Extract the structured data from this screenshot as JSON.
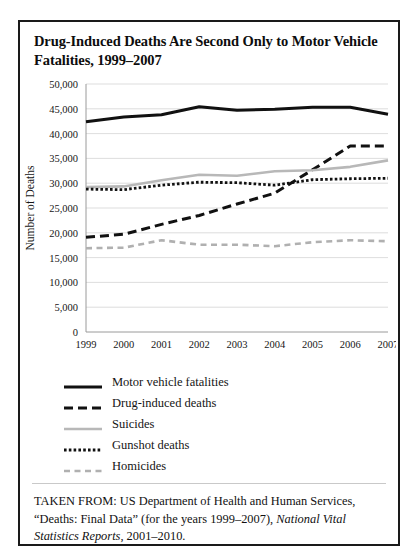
{
  "title": "Drug-Induced Deaths Are Second Only to Motor Vehicle Fatalities, 1999–2007",
  "source": {
    "prefix": "TAKEN FROM: US Department of Health and Human Services, “Deaths: Final Data” (for the years 1999–2007), ",
    "italic": "National Vital Statistics Reports",
    "suffix": ", 2001–2010."
  },
  "legend": [
    {
      "label": "Motor vehicle fatalities",
      "style": "solid-black",
      "color": "#111111"
    },
    {
      "label": "Drug-induced deaths",
      "style": "dash-black",
      "color": "#111111"
    },
    {
      "label": "Suicides",
      "style": "solid-gray",
      "color": "#b8b8b8"
    },
    {
      "label": "Gunshot deaths",
      "style": "dot-black",
      "color": "#111111"
    },
    {
      "label": "Homicides",
      "style": "dash-gray",
      "color": "#b0b0b0"
    }
  ],
  "chart_data": {
    "type": "line",
    "title": "Drug-Induced Deaths Are Second Only to Motor Vehicle Fatalities, 1999–2007",
    "xlabel": "",
    "ylabel": "Number of Deaths",
    "x": [
      1999,
      2000,
      2001,
      2002,
      2003,
      2004,
      2005,
      2006,
      2007
    ],
    "categories": [
      "1999",
      "2000",
      "2001",
      "2002",
      "2003",
      "2004",
      "2005",
      "2006",
      "2007"
    ],
    "ylim": [
      0,
      50000
    ],
    "yticks": [
      0,
      5000,
      10000,
      15000,
      20000,
      25000,
      30000,
      35000,
      40000,
      45000,
      50000
    ],
    "ytick_labels": [
      "0",
      "5,000",
      "10,000",
      "15,000",
      "20,000",
      "25,000",
      "30,000",
      "35,000",
      "40,000",
      "45,000",
      "50,000"
    ],
    "grid": true,
    "legend_position": "below",
    "series": [
      {
        "name": "Motor vehicle fatalities",
        "style": "solid-black",
        "color": "#111111",
        "values": [
          42400,
          43350,
          43800,
          45400,
          44700,
          44900,
          45300,
          45300,
          43900
        ]
      },
      {
        "name": "Drug-induced deaths",
        "style": "dash-black",
        "color": "#111111",
        "values": [
          19100,
          19700,
          21700,
          23500,
          25800,
          28000,
          32700,
          37500,
          37500
        ]
      },
      {
        "name": "Suicides",
        "style": "solid-gray",
        "color": "#b8b8b8",
        "values": [
          29200,
          29350,
          30600,
          31700,
          31500,
          32400,
          32600,
          33300,
          34600
        ]
      },
      {
        "name": "Gunshot deaths",
        "style": "dot-black",
        "color": "#111111",
        "values": [
          28800,
          28700,
          29600,
          30200,
          30100,
          29600,
          30700,
          30900,
          31000
        ]
      },
      {
        "name": "Homicides",
        "style": "dash-gray",
        "color": "#b0b0b0",
        "values": [
          16900,
          17000,
          18500,
          17600,
          17600,
          17300,
          18100,
          18500,
          18300
        ]
      }
    ]
  }
}
